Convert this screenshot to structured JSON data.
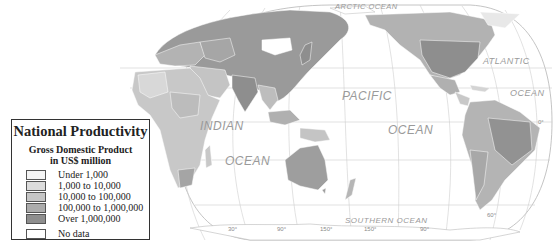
{
  "legend": {
    "title": "National Productivity",
    "subtitle_line1": "Gross Domestic Product",
    "subtitle_line2": "in US$ million",
    "classes": [
      {
        "label": "Under 1,000",
        "color": "#f4f4f4"
      },
      {
        "label": "1,000 to 10,000",
        "color": "#dcdcdc"
      },
      {
        "label": "10,000 to 100,000",
        "color": "#c6c6c6"
      },
      {
        "label": "100,000 to 1,000,000",
        "color": "#acacac"
      },
      {
        "label": "Over 1,000,000",
        "color": "#8e8e8e"
      }
    ],
    "no_data": {
      "label": "No data",
      "color": "#ffffff"
    }
  },
  "ocean_labels": {
    "arctic": "ARCTIC OCEAN",
    "atlantic_1": "ATLANTIC",
    "atlantic_2": "OCEAN",
    "pacific_1": "PACIFIC",
    "pacific_2": "OCEAN",
    "indian_1": "INDIAN",
    "indian_2": "OCEAN",
    "southern": "SOUTHERN OCEAN"
  },
  "degree_labels": {
    "equator": "0°",
    "lon_30": "30°",
    "lon_90": "90°",
    "lon_150": "150°",
    "lon_150w": "150°",
    "lon_90w": "90°",
    "lat_60s": "60°"
  },
  "colors": {
    "graticule": "#c8c8c8",
    "outline": "#aaaaaa",
    "ocean": "#ffffff",
    "land_light": "#dcdcdc",
    "land_mid": "#c6c6c6",
    "land_dark": "#acacac",
    "land_darkest": "#8e8e8e"
  }
}
